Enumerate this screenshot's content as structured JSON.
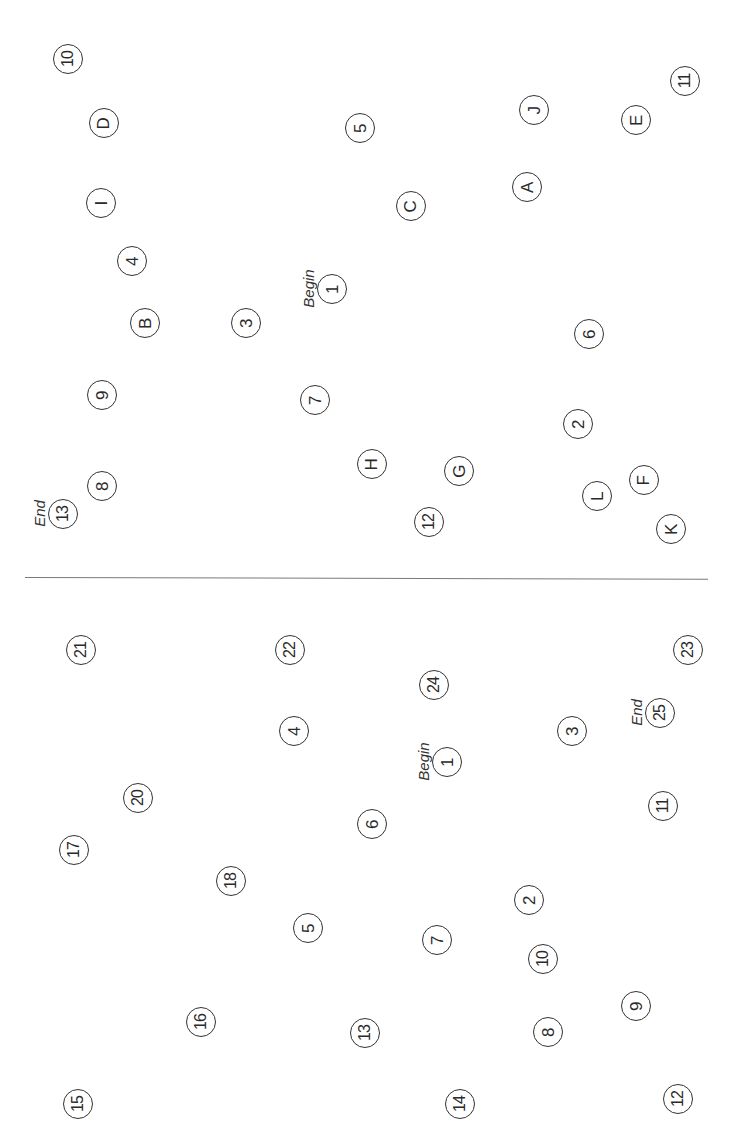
{
  "sheet": {
    "orientation": "rotated-90-ccw",
    "part_b": {
      "begin_label": "Begin",
      "end_label": "End",
      "nodes": [
        {
          "label": "1",
          "x": 332,
          "y": 289
        },
        {
          "label": "A",
          "x": 527,
          "y": 187
        },
        {
          "label": "2",
          "x": 578,
          "y": 424
        },
        {
          "label": "B",
          "x": 145,
          "y": 323
        },
        {
          "label": "3",
          "x": 246,
          "y": 323
        },
        {
          "label": "C",
          "x": 411,
          "y": 206
        },
        {
          "label": "4",
          "x": 132,
          "y": 261
        },
        {
          "label": "D",
          "x": 104,
          "y": 123
        },
        {
          "label": "5",
          "x": 360,
          "y": 128
        },
        {
          "label": "E",
          "x": 636,
          "y": 120
        },
        {
          "label": "6",
          "x": 589,
          "y": 334
        },
        {
          "label": "F",
          "x": 644,
          "y": 480
        },
        {
          "label": "7",
          "x": 315,
          "y": 400
        },
        {
          "label": "G",
          "x": 459,
          "y": 471
        },
        {
          "label": "8",
          "x": 102,
          "y": 486
        },
        {
          "label": "H",
          "x": 372,
          "y": 464
        },
        {
          "label": "9",
          "x": 102,
          "y": 395
        },
        {
          "label": "I",
          "x": 101,
          "y": 203
        },
        {
          "label": "10",
          "x": 68,
          "y": 59
        },
        {
          "label": "J",
          "x": 534,
          "y": 110
        },
        {
          "label": "11",
          "x": 685,
          "y": 81
        },
        {
          "label": "K",
          "x": 671,
          "y": 529
        },
        {
          "label": "12",
          "x": 429,
          "y": 522
        },
        {
          "label": "L",
          "x": 597,
          "y": 496
        },
        {
          "label": "13",
          "x": 63,
          "y": 514
        }
      ],
      "begin_node": "1",
      "end_node": "13"
    },
    "part_a": {
      "begin_label": "Begin",
      "end_label": "End",
      "nodes": [
        {
          "label": "1",
          "x": 447,
          "y": 762
        },
        {
          "label": "2",
          "x": 529,
          "y": 900
        },
        {
          "label": "3",
          "x": 572,
          "y": 731
        },
        {
          "label": "4",
          "x": 294,
          "y": 731
        },
        {
          "label": "5",
          "x": 308,
          "y": 928
        },
        {
          "label": "6",
          "x": 372,
          "y": 824
        },
        {
          "label": "7",
          "x": 437,
          "y": 940
        },
        {
          "label": "8",
          "x": 548,
          "y": 1032
        },
        {
          "label": "9",
          "x": 636,
          "y": 1006
        },
        {
          "label": "10",
          "x": 543,
          "y": 959
        },
        {
          "label": "11",
          "x": 663,
          "y": 806
        },
        {
          "label": "12",
          "x": 678,
          "y": 1099
        },
        {
          "label": "13",
          "x": 365,
          "y": 1033
        },
        {
          "label": "14",
          "x": 460,
          "y": 1104
        },
        {
          "label": "15",
          "x": 78,
          "y": 1104
        },
        {
          "label": "16",
          "x": 201,
          "y": 1022
        },
        {
          "label": "17",
          "x": 74,
          "y": 850
        },
        {
          "label": "18",
          "x": 231,
          "y": 881
        },
        {
          "label": "19",
          "x": 0,
          "y": 0,
          "hidden": true
        },
        {
          "label": "20",
          "x": 138,
          "y": 798
        },
        {
          "label": "21",
          "x": 81,
          "y": 650
        },
        {
          "label": "22",
          "x": 290,
          "y": 650
        },
        {
          "label": "23",
          "x": 688,
          "y": 650
        },
        {
          "label": "24",
          "x": 434,
          "y": 685
        },
        {
          "label": "25",
          "x": 660,
          "y": 713
        }
      ],
      "begin_node": "1",
      "end_node": "25"
    }
  },
  "colors": {
    "ink": "#333333",
    "divider": "#7a7a7a",
    "background": "#ffffff"
  }
}
